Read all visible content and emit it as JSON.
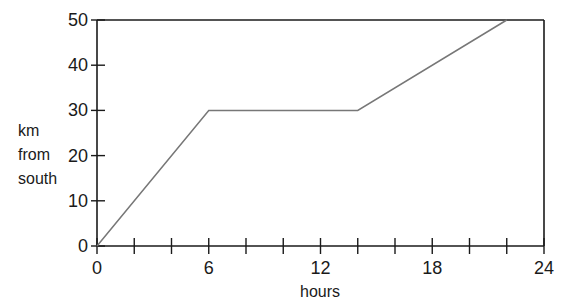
{
  "chart_data": {
    "type": "line",
    "title": "",
    "xlabel": "hours",
    "ylabel": [
      "km",
      "from",
      "south"
    ],
    "xlim": [
      0,
      24
    ],
    "ylim": [
      0,
      50
    ],
    "x_ticks": [
      0,
      6,
      12,
      18,
      24
    ],
    "x_minor_ticks": [
      2,
      4,
      8,
      10,
      14,
      16,
      20,
      22
    ],
    "y_ticks": [
      0,
      10,
      20,
      30,
      40,
      50
    ],
    "grid": false,
    "legend": null,
    "series": [
      {
        "name": "distance",
        "x": [
          0,
          6,
          14,
          22
        ],
        "y": [
          0,
          30,
          30,
          50
        ],
        "color": "#777777"
      }
    ],
    "frame": {
      "top": true,
      "right": true
    }
  }
}
